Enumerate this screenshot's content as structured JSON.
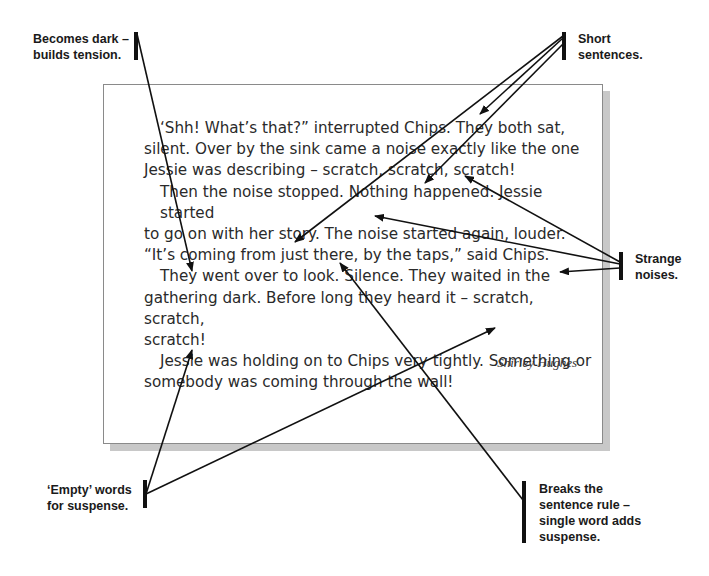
{
  "passage": {
    "paragraphs": [
      "‘Shh! What’s that?” interrupted Chips. They both sat, silent. Over by the sink came a noise exactly like the one Jessie was describing – scratch, scratch, scratch!",
      "Then the noise stopped. Nothing happened. Jessie started to go on with her story. The noise started again, louder. “It’s coming from just there, by the taps,” said Chips.",
      "They went over to look. Silence. They waited in the gathering dark. Before long they heard it – scratch, scratch, scratch!",
      "Jessie was holding on to Chips very tightly. Something or somebody was coming through the wall!"
    ],
    "lines": [
      "‘Shh! What’s that?” interrupted Chips. They both sat,",
      "silent. Over by the sink came a noise exactly like the one",
      "Jessie was describing – scratch, scratch, scratch!",
      "Then the noise stopped. Nothing happened. Jessie started",
      "to go on with her story. The noise started again, louder.",
      "“It’s coming from just there, by the taps,” said Chips.",
      "They went over to look. Silence. They waited in the",
      "gathering dark. Before long they heard it – scratch, scratch,",
      "scratch!",
      "Jessie was holding on to Chips very tightly. Something or",
      "somebody was coming through the wall!"
    ],
    "author": "Shirley Hughes"
  },
  "annotations": {
    "becomes_dark": {
      "line1": "Becomes dark –",
      "line2": "builds tension."
    },
    "short_sentences": {
      "line1": "Short",
      "line2": "sentences."
    },
    "strange_noises": {
      "line1": "Strange",
      "line2": "noises."
    },
    "empty_words": {
      "line1": "‘Empty’ words",
      "line2": "for suspense."
    },
    "breaks_rule": {
      "line1": "Breaks the",
      "line2": "sentence rule –",
      "line3": "single word adds",
      "line4": "suspense."
    }
  },
  "colors": {
    "text": "#2a2a2a",
    "arrow": "#111111",
    "box_border": "#8a8a8a",
    "shadow": "#c8c8c8"
  }
}
